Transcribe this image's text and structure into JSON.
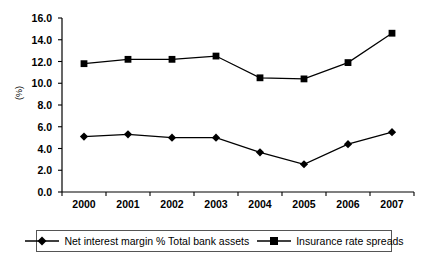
{
  "chart_data": {
    "type": "line",
    "title": "",
    "subtitle": "",
    "xlabel": "",
    "ylabel": "(%)",
    "categories": [
      "2000",
      "2001",
      "2002",
      "2003",
      "2004",
      "2005",
      "2006",
      "2007"
    ],
    "ylim": [
      0.0,
      16.0
    ],
    "ytick_step": 2.0,
    "ytick_labels": [
      "0.0",
      "2.0",
      "4.0",
      "6.0",
      "8.0",
      "10.0",
      "12.0",
      "14.0",
      "16.0"
    ],
    "grid": false,
    "legend_position": "bottom",
    "series": [
      {
        "name": "Net interest margin % Total bank assets",
        "marker": "diamond",
        "color": "#000000",
        "values": [
          5.1,
          5.3,
          5.0,
          5.0,
          3.65,
          2.55,
          4.4,
          5.5
        ]
      },
      {
        "name": "Insurance rate spreads",
        "marker": "square",
        "color": "#000000",
        "values": [
          11.8,
          12.2,
          12.2,
          12.5,
          10.5,
          10.4,
          11.9,
          14.6
        ]
      }
    ]
  },
  "legend": {
    "entries": [
      {
        "label": "Net interest margin % Total bank assets"
      },
      {
        "label": "Insurance rate spreads"
      }
    ]
  }
}
